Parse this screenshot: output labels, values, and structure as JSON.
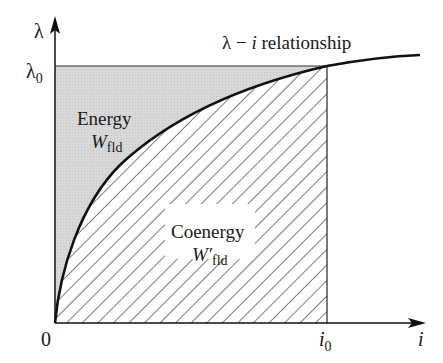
{
  "diagram": {
    "type": "lambda-i magnetization curve with energy / coenergy areas",
    "curve_label": {
      "lambda": "λ",
      "dash": " − ",
      "i": "i",
      "rest": " relationship"
    },
    "y_axis": {
      "symbol": "λ",
      "tick_symbol": "λ",
      "tick_sub": "0"
    },
    "x_axis": {
      "symbol": "i",
      "tick_symbol": "i",
      "tick_sub": "0",
      "origin": "0"
    },
    "energy_region": {
      "label": "Energy",
      "symbol": "W",
      "sub": "fld",
      "fill": "#d6d6d6"
    },
    "coenergy_region": {
      "label": "Coenergy",
      "symbol": "W′",
      "sub": "fld",
      "hatch_color": "#333333"
    },
    "colors": {
      "curve": "#111111",
      "axis": "#111111",
      "background": "#ffffff"
    }
  }
}
